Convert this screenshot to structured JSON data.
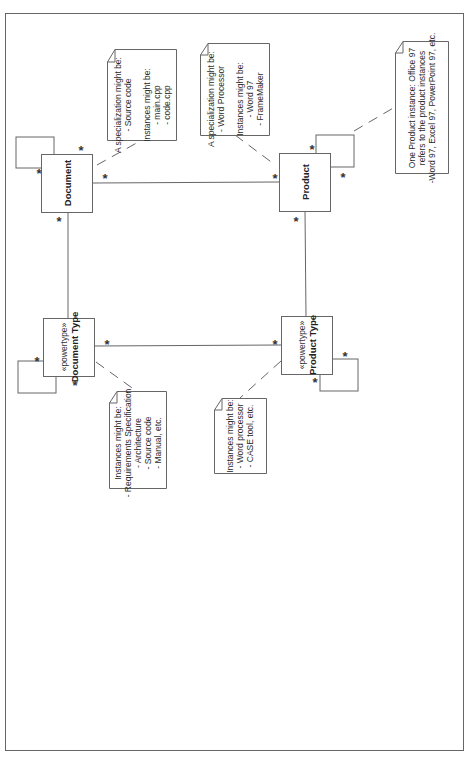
{
  "diagram": {
    "type": "UML class diagram (powertype pattern), rotated 90°",
    "classes": {
      "document": {
        "name": "Document"
      },
      "product": {
        "name": "Product"
      },
      "document_type": {
        "stereotype": "«powertype»",
        "name": "Document Type"
      },
      "product_type": {
        "stereotype": "«powertype»",
        "name": "Product Type"
      }
    },
    "multiplicity": "*",
    "notes": {
      "document_note": {
        "lines": [
          "A specialization might be:",
          "- Source code",
          "",
          "Instances might be:",
          "- main.cpp",
          "- code.cpp"
        ]
      },
      "product_note": {
        "lines": [
          "A specialization might be:",
          "- Word Processor",
          "",
          "Instances might be:",
          "- Word 97",
          "- FrameMaker"
        ]
      },
      "product_instance_note": {
        "lines": [
          "One Product instance: Office 97",
          "refers to the product instances",
          "-Word 97, Excel 97, PowerPoint 97, etc."
        ]
      },
      "document_type_note": {
        "lines": [
          "Instances might be:",
          "- Requirements Specification",
          "- Architecture",
          "- Source code",
          "- Manual, etc."
        ]
      },
      "product_type_note": {
        "lines": [
          "Instances might be:",
          "- Word processor",
          "- CASE tool, etc."
        ]
      }
    },
    "associations": [
      {
        "from": "Document",
        "to": "Product",
        "from_mult": "*",
        "to_mult": "*"
      },
      {
        "from": "Document",
        "to": "Document Type",
        "from_mult": "*",
        "to_mult": "*"
      },
      {
        "from": "Product",
        "to": "Product Type",
        "from_mult": "*",
        "to_mult": "*"
      },
      {
        "from": "Document Type",
        "to": "Product Type",
        "from_mult": "*",
        "to_mult": "*"
      },
      {
        "from": "Document",
        "to": "Document",
        "self": true,
        "from_mult": "*",
        "to_mult": "*"
      },
      {
        "from": "Product",
        "to": "Product",
        "self": true,
        "from_mult": "*",
        "to_mult": "*"
      },
      {
        "from": "Document Type",
        "to": "Document Type",
        "self": true,
        "from_mult": "*",
        "to_mult": "*"
      },
      {
        "from": "Product Type",
        "to": "Product Type",
        "self": true,
        "from_mult": "*",
        "to_mult": "*"
      }
    ],
    "colors": {
      "line": "#555555",
      "background": "#ffffff"
    }
  }
}
